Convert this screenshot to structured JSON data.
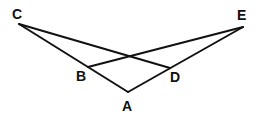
{
  "diagram": {
    "type": "geometry",
    "background": "#ffffff",
    "stroke_color": "#111111",
    "points": {
      "C": {
        "label": "C",
        "x": 19,
        "y": 24
      },
      "E": {
        "label": "E",
        "x": 243,
        "y": 27
      },
      "B": {
        "label": "B",
        "x": 88,
        "y": 67
      },
      "D": {
        "label": "D",
        "x": 170,
        "y": 68
      },
      "A": {
        "label": "A",
        "x": 128,
        "y": 92
      }
    },
    "segments": [
      {
        "from": "C",
        "to": "A"
      },
      {
        "from": "C",
        "to": "D"
      },
      {
        "from": "E",
        "to": "B"
      },
      {
        "from": "E",
        "to": "A"
      }
    ],
    "labels": {
      "C": {
        "text": "C",
        "x": 12,
        "y": 19
      },
      "E": {
        "text": "E",
        "x": 237,
        "y": 20
      },
      "B": {
        "text": "B",
        "x": 76,
        "y": 81
      },
      "D": {
        "text": "D",
        "x": 170,
        "y": 82
      },
      "A": {
        "text": "A",
        "x": 122,
        "y": 111
      }
    }
  }
}
